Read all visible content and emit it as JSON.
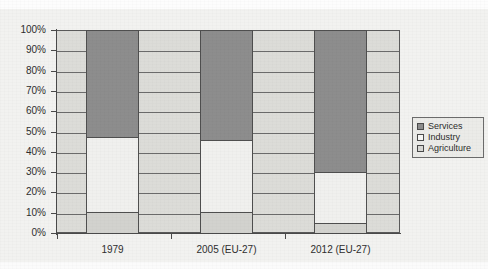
{
  "figure": {
    "background_color": "#f2f2f0",
    "title_partial": "",
    "plot_background_color": "#dcdcd8"
  },
  "chart_data": {
    "type": "bar",
    "subtype": "stacked-100-percent",
    "title": "",
    "xlabel": "",
    "ylabel": "",
    "categories": [
      "1979",
      "2005 (EU-27)",
      "2012 (EU-27)"
    ],
    "series": [
      {
        "name": "Services",
        "color": "#8d8d8d",
        "values": [
          53.0,
          54.5,
          70.5
        ]
      },
      {
        "name": "Industry",
        "color": "#f0f0ee",
        "values": [
          37.0,
          35.5,
          25.0
        ]
      },
      {
        "name": "Agriculture",
        "color": "#d2d2ce",
        "values": [
          10.0,
          10.0,
          4.5
        ]
      }
    ],
    "stack_order_bottom_to_top": [
      "Agriculture",
      "Industry",
      "Services"
    ],
    "ylim": [
      0,
      100
    ],
    "ytick_values": [
      0,
      10,
      20,
      30,
      40,
      50,
      60,
      70,
      80,
      90,
      100
    ],
    "ytick_labels": [
      "0%",
      "10%",
      "20%",
      "30%",
      "40%",
      "50%",
      "60%",
      "70%",
      "80%",
      "90%",
      "100%"
    ],
    "grid": true,
    "grid_axis": "y",
    "legend_position": "right",
    "legend_entries": [
      "Services",
      "Industry",
      "Agriculture"
    ]
  },
  "axis": {
    "y_labels": [
      "100%",
      "90%",
      "80%",
      "70%",
      "60%",
      "50%",
      "40%",
      "30%",
      "20%",
      "10%",
      "0%"
    ],
    "x_labels": [
      "1979",
      "2005 (EU-27)",
      "2012 (EU-27)"
    ]
  },
  "legend": {
    "items": [
      {
        "label": "Services",
        "swatch_color": "#8d8d8d"
      },
      {
        "label": "Industry",
        "swatch_color": "#f7f7f5"
      },
      {
        "label": "Agriculture",
        "swatch_color": "#d8d8d4"
      }
    ]
  }
}
